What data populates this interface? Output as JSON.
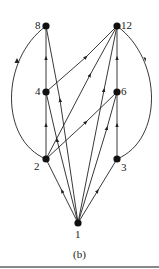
{
  "caption": "(b)",
  "nodes": [
    {
      "id": "1",
      "label": "1"
    },
    {
      "id": "2",
      "label": "2"
    },
    {
      "id": "3",
      "label": "3"
    },
    {
      "id": "4",
      "label": "4"
    },
    {
      "id": "6",
      "label": "6"
    },
    {
      "id": "8",
      "label": "8"
    },
    {
      "id": "12",
      "label": "12"
    }
  ],
  "edges": [
    [
      "1",
      "2"
    ],
    [
      "1",
      "3"
    ],
    [
      "1",
      "4"
    ],
    [
      "1",
      "6"
    ],
    [
      "1",
      "8"
    ],
    [
      "1",
      "12"
    ],
    [
      "2",
      "4"
    ],
    [
      "2",
      "6"
    ],
    [
      "2",
      "8"
    ],
    [
      "2",
      "12"
    ],
    [
      "3",
      "6"
    ],
    [
      "3",
      "12"
    ],
    [
      "4",
      "8"
    ],
    [
      "4",
      "12"
    ],
    [
      "6",
      "12"
    ]
  ],
  "colors": {
    "ink": "#222222"
  }
}
